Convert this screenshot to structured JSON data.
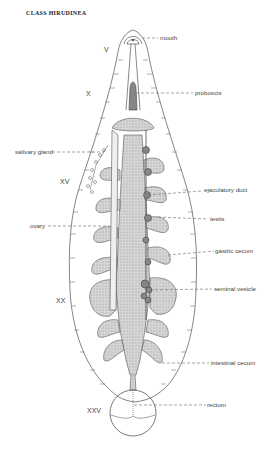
{
  "title": "CLASS HIRUDINEA",
  "segments": [
    {
      "id": "v",
      "label": "V"
    },
    {
      "id": "x",
      "label": "X"
    },
    {
      "id": "xv",
      "label": "XV"
    },
    {
      "id": "xx",
      "label": "XX"
    },
    {
      "id": "xxv",
      "label": "XXV"
    }
  ],
  "labels": {
    "mouth": "mouth",
    "proboscis": "proboscis",
    "salivary_gland": "salivary gland",
    "ejaculatory_duct": "ejaculatory duct",
    "ovary": "ovary",
    "testis": "testis",
    "gastric_cecum": "gastric cecum",
    "seminal_vesicle": "seminal vesicle",
    "intestinal_cecum": "intestinal cecum",
    "rectum": "rectum"
  },
  "colors": {
    "outline": "#555555",
    "organ_fill": "#cfcfcf",
    "dark_fill": "#6a6a6a"
  }
}
